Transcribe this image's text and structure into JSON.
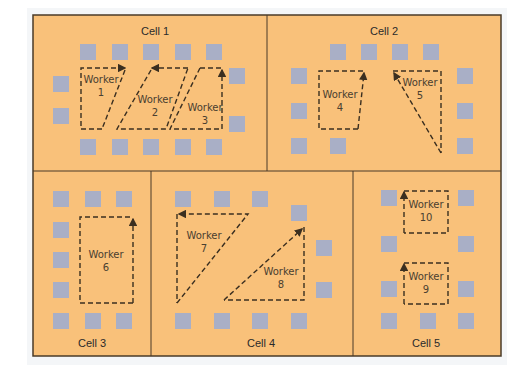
{
  "diagram": {
    "type": "cellular-manufacturing-layout",
    "colors": {
      "floor": "#f9c17a",
      "station": "#a9afc6",
      "border": "#4a3b28",
      "path": "#3b2f20"
    },
    "worker_word": "Worker",
    "cells": [
      {
        "id": "cell1",
        "label": "Cell 1",
        "workers": [
          "1",
          "2",
          "3"
        ]
      },
      {
        "id": "cell2",
        "label": "Cell 2",
        "workers": [
          "4",
          "5"
        ]
      },
      {
        "id": "cell3",
        "label": "Cell 3",
        "workers": [
          "6"
        ]
      },
      {
        "id": "cell4",
        "label": "Cell 4",
        "workers": [
          "7",
          "8"
        ]
      },
      {
        "id": "cell5",
        "label": "Cell 5",
        "workers": [
          "10",
          "9"
        ]
      }
    ],
    "workers": {
      "w1": {
        "title": "Worker",
        "num": "1"
      },
      "w2": {
        "title": "Worker",
        "num": "2"
      },
      "w3": {
        "title": "Worker",
        "num": "3"
      },
      "w4": {
        "title": "Worker",
        "num": "4"
      },
      "w5": {
        "title": "Worker",
        "num": "5"
      },
      "w6": {
        "title": "Worker",
        "num": "6"
      },
      "w7": {
        "title": "Worker",
        "num": "7"
      },
      "w8": {
        "title": "Worker",
        "num": "8"
      },
      "w9": {
        "title": "Worker",
        "num": "9"
      },
      "w10": {
        "title": "Worker",
        "num": "10"
      }
    }
  }
}
